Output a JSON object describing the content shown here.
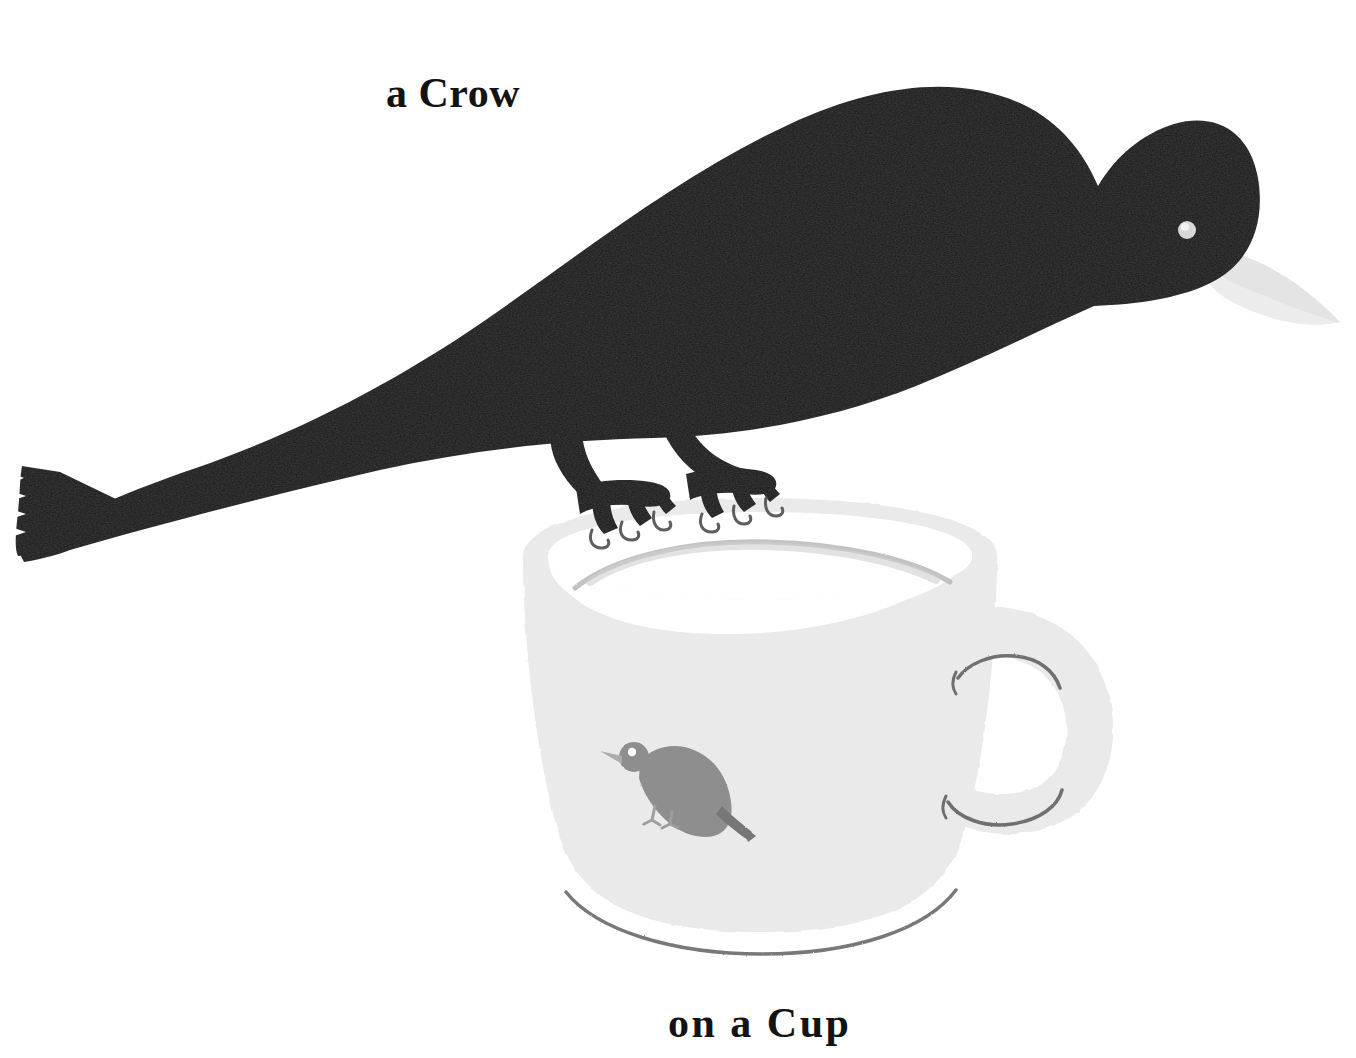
{
  "illustration": {
    "title_top": "a Crow",
    "title_bottom": "on a Cup",
    "background_color": "#ffffff",
    "crow": {
      "name": "crow",
      "body_color": "#161616",
      "beak_color": "#e4e4e4",
      "eye_color": "#d8d8d8",
      "leg_color": "#161616",
      "claw_color": "#6d6d6d"
    },
    "cup": {
      "name": "cup",
      "body_color": "#eaeaea",
      "interior_color": "#ffffff",
      "rim_line_color": "#b9b9b9",
      "base_line_color": "#6a6a6a",
      "handle_line_color": "#7b7b7b",
      "decoration": {
        "name": "small-bird-decoration",
        "color": "#8d8d8d",
        "eye_color": "#ffffff",
        "beak_color": "#b5b5b5"
      }
    }
  }
}
